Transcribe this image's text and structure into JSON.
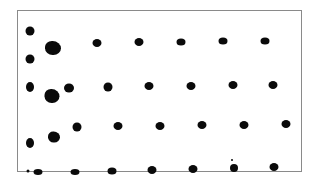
{
  "image": {
    "description": "Scanned photograph of a framed white panel with a roughly regular grid of black dots; irregular larger blobs near the left column",
    "frame": {
      "x": 17,
      "y": 10,
      "width": 285,
      "height": 162,
      "border_color": "#8a8a8a"
    },
    "dot_color": "#0a0a0a",
    "background_color": "#ffffff",
    "dots": [
      {
        "x": 30,
        "y": 31,
        "w": 9,
        "h": 9
      },
      {
        "x": 53,
        "y": 48,
        "w": 16,
        "h": 14
      },
      {
        "x": 30,
        "y": 59,
        "w": 9,
        "h": 9
      },
      {
        "x": 97,
        "y": 43,
        "w": 9,
        "h": 8
      },
      {
        "x": 139,
        "y": 42,
        "w": 9,
        "h": 8
      },
      {
        "x": 181,
        "y": 42,
        "w": 9,
        "h": 7
      },
      {
        "x": 223,
        "y": 41,
        "w": 9,
        "h": 7
      },
      {
        "x": 265,
        "y": 41,
        "w": 9,
        "h": 7
      },
      {
        "x": 30,
        "y": 87,
        "w": 8,
        "h": 10
      },
      {
        "x": 52,
        "y": 96,
        "w": 15,
        "h": 14
      },
      {
        "x": 69,
        "y": 88,
        "w": 10,
        "h": 9
      },
      {
        "x": 108,
        "y": 87,
        "w": 9,
        "h": 9
      },
      {
        "x": 149,
        "y": 86,
        "w": 9,
        "h": 8
      },
      {
        "x": 191,
        "y": 86,
        "w": 9,
        "h": 8
      },
      {
        "x": 233,
        "y": 85,
        "w": 9,
        "h": 8
      },
      {
        "x": 273,
        "y": 85,
        "w": 9,
        "h": 8
      },
      {
        "x": 30,
        "y": 143,
        "w": 8,
        "h": 10
      },
      {
        "x": 54,
        "y": 137,
        "w": 12,
        "h": 11
      },
      {
        "x": 77,
        "y": 127,
        "w": 9,
        "h": 9
      },
      {
        "x": 118,
        "y": 126,
        "w": 9,
        "h": 8
      },
      {
        "x": 160,
        "y": 126,
        "w": 9,
        "h": 8
      },
      {
        "x": 202,
        "y": 125,
        "w": 9,
        "h": 8
      },
      {
        "x": 244,
        "y": 125,
        "w": 9,
        "h": 8
      },
      {
        "x": 286,
        "y": 124,
        "w": 9,
        "h": 8
      },
      {
        "x": 28,
        "y": 171,
        "w": 3,
        "h": 3
      },
      {
        "x": 38,
        "y": 172,
        "w": 9,
        "h": 6
      },
      {
        "x": 75,
        "y": 172,
        "w": 9,
        "h": 6
      },
      {
        "x": 112,
        "y": 171,
        "w": 9,
        "h": 7
      },
      {
        "x": 152,
        "y": 170,
        "w": 9,
        "h": 8
      },
      {
        "x": 193,
        "y": 169,
        "w": 9,
        "h": 8
      },
      {
        "x": 234,
        "y": 168,
        "w": 8,
        "h": 8
      },
      {
        "x": 274,
        "y": 167,
        "w": 9,
        "h": 8
      },
      {
        "x": 232,
        "y": 160,
        "w": 2,
        "h": 2
      }
    ]
  }
}
